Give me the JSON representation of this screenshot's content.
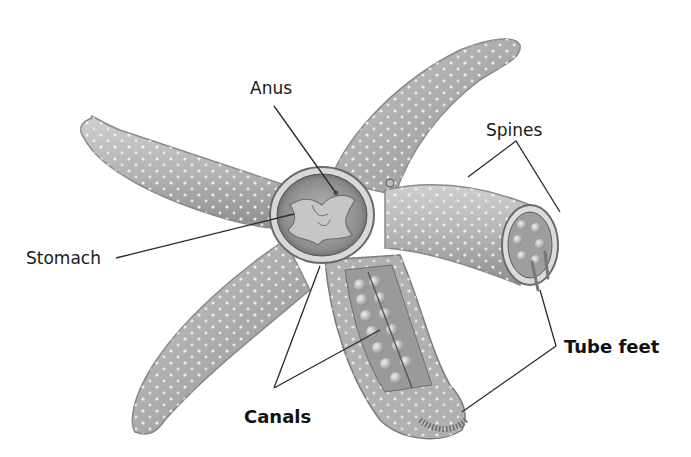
{
  "diagram": {
    "colors": {
      "background": "#ffffff",
      "body_light": "#d4d4d4",
      "body_mid": "#a8a8a8",
      "body_dark": "#7a7a7a",
      "spine_dots": "#f2f2f2",
      "leader_lines": "#2a2a2a",
      "label_text": "#1a1a1a"
    },
    "labels": [
      {
        "id": "anus",
        "text": "Anus",
        "style": "regular",
        "x": 250,
        "y": 78
      },
      {
        "id": "spines",
        "text": "Spines",
        "style": "regular",
        "x": 486,
        "y": 122
      },
      {
        "id": "stomach",
        "text": "Stomach",
        "style": "regular",
        "x": 26,
        "y": 245
      },
      {
        "id": "tube_feet",
        "text": "Tube feet",
        "style": "bold",
        "x": 564,
        "y": 338
      },
      {
        "id": "canals",
        "text": "Canals",
        "style": "bold",
        "x": 244,
        "y": 416
      }
    ]
  }
}
